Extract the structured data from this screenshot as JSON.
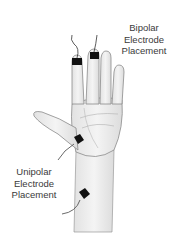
{
  "figure": {
    "labels": {
      "bipolar": [
        "Bipolar",
        "Electrode",
        "Placement"
      ],
      "unipolar": [
        "Unipolar",
        "Electrode",
        "Placement"
      ]
    },
    "colors": {
      "skin_fill": "#efefef",
      "skin_shade": "#d6d6d6",
      "outline": "#8a8a8a",
      "electrode": "#111111",
      "text": "#3a3a3a"
    }
  }
}
